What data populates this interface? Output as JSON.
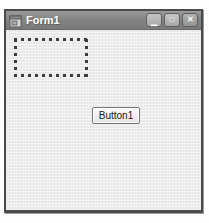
{
  "window": {
    "title": "Form1",
    "titlebar_buttons": {
      "minimize_glyph": "▁",
      "maximize_glyph": "□",
      "close_glyph": "✕"
    }
  },
  "form": {
    "button1_label": "Button1"
  },
  "colors": {
    "titlebar_gray": "#848484",
    "window_border": "#4a4a4a",
    "client_background": "#ececec",
    "marquee_dot": "#3c3c3c",
    "title_text": "#ffffff",
    "button_text": "#1a1a1a"
  }
}
